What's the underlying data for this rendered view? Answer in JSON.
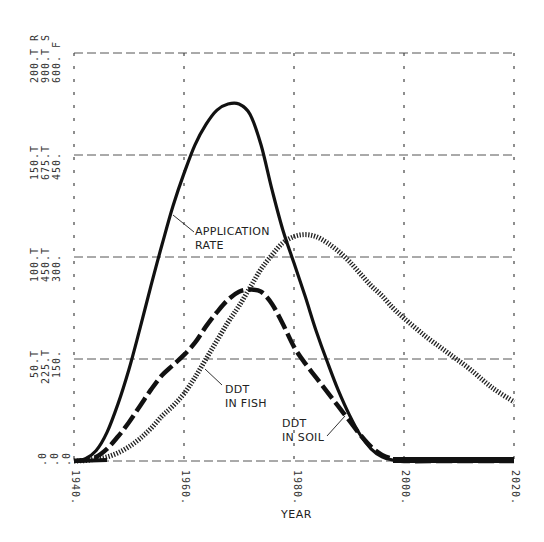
{
  "chart_data": {
    "type": "line",
    "title": "",
    "xlabel": "YEAR",
    "ylabel": "",
    "xlim": [
      1940,
      2020
    ],
    "ylim": [
      0,
      200
    ],
    "grid": true,
    "legend": "none (inline annotations)",
    "x_ticks": [
      "1940.",
      "1960.",
      "1980.",
      "2000.",
      "2020."
    ],
    "y_axes": [
      {
        "scale": "R (application rate)",
        "ticks": [
          ".0",
          "50.T",
          "100.T",
          "150.T",
          "200.T R"
        ]
      },
      {
        "scale": "S (DDT in soil)",
        "ticks": [
          ".0",
          "225.T",
          "450.T",
          "675.T",
          "900.T S"
        ]
      },
      {
        "scale": "F (DDT in fish)",
        "ticks": [
          ".0",
          "150.",
          "300.",
          "450.",
          "600. F"
        ]
      }
    ],
    "annotations": [
      "APPLICATION RATE",
      "DDT IN FISH",
      "DDT IN SOIL"
    ],
    "series": [
      {
        "name": "APPLICATION RATE",
        "marker": "R",
        "style": "solid",
        "x": [
          1940,
          1942,
          1944,
          1946,
          1948,
          1950,
          1952,
          1954,
          1956,
          1958,
          1960,
          1962,
          1964,
          1966,
          1968,
          1970,
          1972,
          1974,
          1976,
          1978,
          1980,
          1982,
          1984,
          1986,
          1988,
          1990,
          1992,
          1994,
          1996,
          1998,
          2000,
          2010,
          2020
        ],
        "values": [
          0,
          1,
          5,
          14,
          28,
          45,
          65,
          86,
          106,
          125,
          141,
          155,
          165,
          172,
          175,
          175,
          170,
          155,
          133,
          113,
          97,
          81,
          64,
          49,
          35,
          23,
          13,
          6,
          2,
          0.5,
          0,
          0,
          0
        ]
      },
      {
        "name": "DDT IN SOIL",
        "marker": "S",
        "style": "dashed",
        "x": [
          1940,
          1942,
          1944,
          1946,
          1948,
          1950,
          1952,
          1954,
          1956,
          1958,
          1960,
          1962,
          1964,
          1966,
          1968,
          1970,
          1972,
          1974,
          1976,
          1978,
          1980,
          1982,
          1984,
          1986,
          1988,
          1990,
          1992,
          1994,
          1996,
          1998,
          2000,
          2010,
          2020
        ],
        "values": [
          0,
          0.5,
          2,
          6,
          12,
          19,
          27,
          35,
          42,
          47,
          52,
          58,
          66,
          73,
          79,
          83,
          84,
          83,
          77,
          67,
          56,
          48,
          41,
          34,
          27,
          20,
          13,
          7,
          3,
          1,
          0,
          0,
          0
        ]
      },
      {
        "name": "DDT IN FISH",
        "marker": "F",
        "style": "dotted",
        "x": [
          1940,
          1942,
          1944,
          1946,
          1948,
          1950,
          1952,
          1954,
          1956,
          1958,
          1960,
          1962,
          1964,
          1966,
          1968,
          1970,
          1972,
          1974,
          1976,
          1978,
          1980,
          1982,
          1984,
          1986,
          1988,
          1990,
          1992,
          1994,
          1996,
          1998,
          2000,
          2004,
          2008,
          2012,
          2016,
          2020
        ],
        "values": [
          0,
          0.2,
          1,
          2,
          4,
          7,
          11,
          16,
          22,
          27,
          33,
          41,
          50,
          59,
          68,
          76,
          85,
          94,
          101,
          107,
          110,
          111,
          110,
          107,
          103,
          98,
          92,
          86,
          81,
          75,
          70,
          61,
          53,
          45,
          36,
          29
        ]
      }
    ]
  },
  "ui": {
    "xlabel": "YEAR",
    "annot_app_1": "APPLICATION",
    "annot_app_2": "RATE",
    "annot_fish_1": "DDT",
    "annot_fish_2": "IN FISH",
    "annot_soil_1": "DDT",
    "annot_soil_2": "IN SOIL",
    "ylabels": {
      "t200": [
        "200.T R",
        "900.T S",
        "600. F"
      ],
      "t150": [
        "150.T",
        "675.T",
        "450."
      ],
      "t100": [
        "100.T",
        "450.T",
        "300."
      ],
      "t50": [
        "50.T",
        "225.T",
        "150."
      ],
      "t0": [
        ".0",
        ".0",
        ".0"
      ]
    },
    "xticks": [
      "1940.",
      "1960.",
      "1980.",
      "2000.",
      "2020."
    ]
  }
}
